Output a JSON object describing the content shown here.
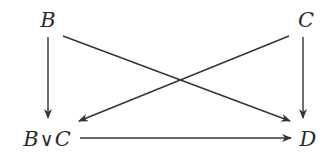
{
  "diagram": {
    "type": "commutative-diagram",
    "nodes": [
      {
        "id": "B",
        "label": "B",
        "position": "top-left"
      },
      {
        "id": "C",
        "label": "C",
        "position": "top-right"
      },
      {
        "id": "BvC",
        "label_parts": [
          "B",
          "∨",
          "C"
        ],
        "label": "B∨C",
        "position": "bottom-left"
      },
      {
        "id": "D",
        "label": "D",
        "position": "bottom-right"
      }
    ],
    "edges": [
      {
        "from": "B",
        "to": "BvC",
        "style": "arrow"
      },
      {
        "from": "B",
        "to": "D",
        "style": "arrow"
      },
      {
        "from": "C",
        "to": "BvC",
        "style": "arrow"
      },
      {
        "from": "C",
        "to": "D",
        "style": "arrow"
      },
      {
        "from": "BvC",
        "to": "D",
        "style": "arrow"
      }
    ],
    "colors": {
      "ink": "#333333",
      "background": "#ffffff"
    }
  }
}
